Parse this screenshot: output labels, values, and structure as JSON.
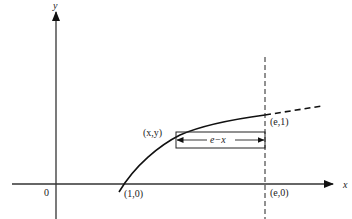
{
  "diagram": {
    "title": "",
    "axes": {
      "x_label": "x",
      "y_label": "y",
      "origin_label": "0"
    },
    "points": {
      "one_zero": "(1,0)",
      "e_zero": "(e,0)",
      "e_one": "(e,1)",
      "x_y": "(x,y)"
    },
    "width_label": "e−x",
    "colors": {
      "stroke": "#111111",
      "background": "#ffffff"
    }
  }
}
